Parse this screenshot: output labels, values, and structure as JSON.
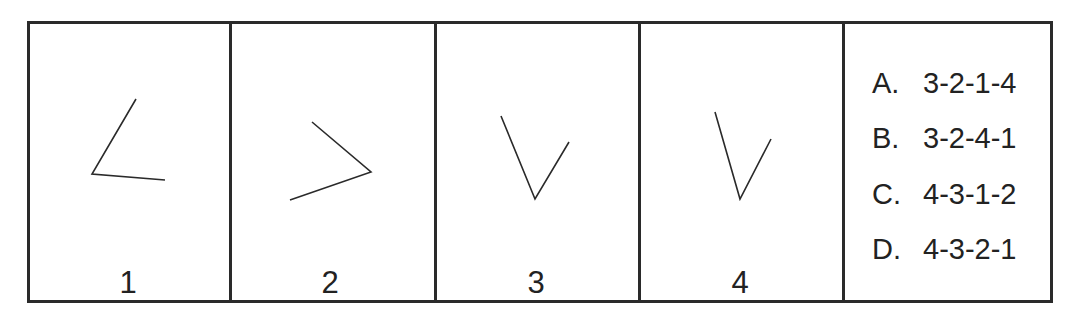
{
  "panels": [
    {
      "label": "1",
      "figure": "angle-opening-right-down",
      "polyline": [
        [
          133,
          96
        ],
        [
          89,
          171
        ],
        [
          162,
          177
        ]
      ]
    },
    {
      "label": "2",
      "figure": "angle-pointing-right",
      "polyline": [
        [
          309,
          119
        ],
        [
          368,
          169
        ],
        [
          287,
          197
        ]
      ]
    },
    {
      "label": "3",
      "figure": "angle-pointing-down",
      "polyline": [
        [
          498,
          113
        ],
        [
          532,
          196
        ],
        [
          566,
          139
        ]
      ]
    },
    {
      "label": "4",
      "figure": "angle-pointing-down-narrow",
      "polyline": [
        [
          712,
          109
        ],
        [
          737,
          196
        ],
        [
          768,
          136
        ]
      ]
    }
  ],
  "options": [
    {
      "letter": "A.",
      "sequence": "3-2-1-4"
    },
    {
      "letter": "B.",
      "sequence": "3-2-4-1"
    },
    {
      "letter": "C.",
      "sequence": "4-3-1-2"
    },
    {
      "letter": "D.",
      "sequence": "4-3-2-1"
    }
  ],
  "colors": {
    "border": "#2a2a2a",
    "stroke": "#2a2a2a",
    "text": "#222222",
    "background": "#ffffff"
  }
}
